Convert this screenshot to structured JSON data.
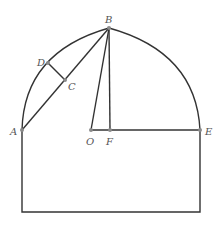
{
  "diagram": {
    "type": "geometry",
    "colors": {
      "stroke": "#333333",
      "point": "#8a8a8a",
      "label": "#555555"
    },
    "points": {
      "A": {
        "label": "A",
        "x": 22,
        "y": 130
      },
      "B": {
        "label": "B",
        "x": 109,
        "y": 28
      },
      "C": {
        "label": "C",
        "x": 65,
        "y": 80
      },
      "D": {
        "label": "D",
        "x": 48,
        "y": 63
      },
      "O": {
        "label": "O",
        "x": 91,
        "y": 130
      },
      "F": {
        "label": "F",
        "x": 110,
        "y": 130
      },
      "E": {
        "label": "E",
        "x": 200,
        "y": 130
      }
    },
    "segments": [
      "AB",
      "DC",
      "BO",
      "BF",
      "OE"
    ],
    "arcs": [
      "A-B",
      "B-E"
    ],
    "rectangle": {
      "left": 22,
      "right": 200,
      "top": 130,
      "bottom": 212
    }
  }
}
